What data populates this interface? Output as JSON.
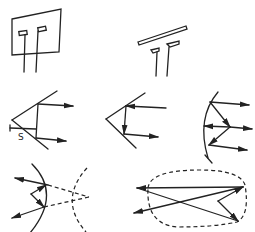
{
  "diagram": {
    "panels": [
      {
        "id": "dipole-plane-reflector",
        "row": 1,
        "col": 1
      },
      {
        "id": "dipole-rod-reflector",
        "row": 1,
        "col": 2
      },
      {
        "id": "corner-reflector-with-spacing",
        "row": 2,
        "col": 1,
        "label": "S"
      },
      {
        "id": "corner-reflector",
        "row": 2,
        "col": 2
      },
      {
        "id": "parabolic-reflector",
        "row": 2,
        "col": 3
      },
      {
        "id": "hyperbolic-reflector-virtual-focus",
        "row": 3,
        "col": 1
      },
      {
        "id": "ellipsoidal-reflector",
        "row": 3,
        "col": 2
      }
    ],
    "labels": {
      "spacing": "S"
    },
    "colors": {
      "line": "#222222",
      "background": "#ffffff"
    }
  }
}
